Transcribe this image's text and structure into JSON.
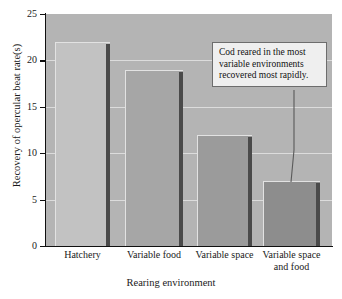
{
  "chart_data": {
    "type": "bar",
    "title": "",
    "xlabel": "Rearing environment",
    "ylabel": "Recovery of opercular beat rate(s)",
    "categories": [
      "Hatchery",
      "Variable food",
      "Variable space",
      "Variable space and food"
    ],
    "category_lines": [
      [
        "Hatchery"
      ],
      [
        "Variable food"
      ],
      [
        "Variable space"
      ],
      [
        "Variable space",
        "and food"
      ]
    ],
    "values": [
      22,
      19,
      12,
      7
    ],
    "ylim": [
      0,
      25
    ],
    "yticks": [
      0,
      5,
      10,
      15,
      20,
      25
    ],
    "ytick_labels": [
      "0",
      "5",
      "10",
      "15",
      "20",
      "25"
    ],
    "grid": true,
    "legend": "none",
    "bar_colors": [
      "#c2c2c2",
      "#a6a6a6",
      "#9b9b9b",
      "#8d8d8d"
    ],
    "plot_background": "#b4b4b4",
    "annotations": [
      {
        "text": "Cod reared in the most variable environments recovered most rapidly.",
        "lines": [
          "Cod reared in the most",
          "variable environments",
          "recovered most rapidly."
        ],
        "points_to": "Variable space and food"
      }
    ]
  }
}
